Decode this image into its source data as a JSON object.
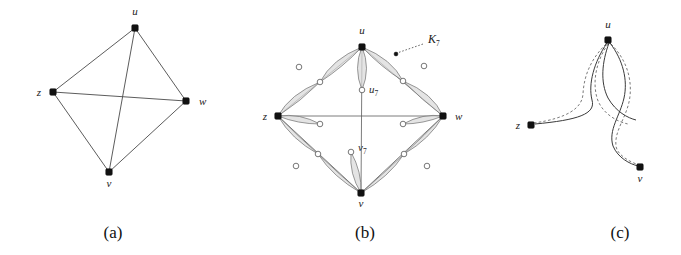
{
  "figure": {
    "width": 681,
    "height": 255,
    "background": "#ffffff",
    "edge_color": "#4a4a4a",
    "lens_fill": "#d9d9d9",
    "lens_stroke": "#6e6e6e",
    "node_filled_color": "#111111",
    "node_open_fill": "#ffffff"
  },
  "captions": [
    {
      "id": "caption-a",
      "text": "(a)",
      "x": 113,
      "y": 238
    },
    {
      "id": "caption-b",
      "text": "(b)",
      "x": 365,
      "y": 238
    },
    {
      "id": "caption-c",
      "text": "(c)",
      "x": 620,
      "y": 238
    }
  ],
  "panel_a": {
    "name": "complete-graph-k4",
    "vertices": [
      {
        "id": "u",
        "label": "u",
        "x": 135,
        "y": 28,
        "lx": 135,
        "ly": 15,
        "anchor": "middle"
      },
      {
        "id": "w",
        "label": "w",
        "x": 186,
        "y": 101,
        "lx": 199,
        "ly": 105,
        "anchor": "start"
      },
      {
        "id": "v",
        "label": "v",
        "x": 109,
        "y": 172,
        "lx": 109,
        "ly": 187,
        "anchor": "middle"
      },
      {
        "id": "z",
        "label": "z",
        "x": 53,
        "y": 92,
        "lx": 41,
        "ly": 96,
        "anchor": "end"
      }
    ],
    "edges": [
      {
        "from": "u",
        "to": "w"
      },
      {
        "from": "u",
        "to": "v"
      },
      {
        "from": "u",
        "to": "z"
      },
      {
        "from": "w",
        "to": "v"
      },
      {
        "from": "w",
        "to": "z"
      },
      {
        "from": "v",
        "to": "z"
      }
    ],
    "edge_count": 6,
    "vertex_count": 4
  },
  "panel_b": {
    "name": "k7-gadget-expansion",
    "gadget_label": "K",
    "gadget_label_sub": "7",
    "gadget_label_x": 432,
    "gadget_label_y": 42,
    "leader_from": {
      "x": 423,
      "y": 44
    },
    "leader_to": {
      "x": 397,
      "y": 53
    },
    "leader_dot": {
      "x": 396,
      "y": 54
    },
    "vertices": [
      {
        "id": "u",
        "label": "u",
        "x": 362,
        "y": 47,
        "lx": 362,
        "ly": 35,
        "anchor": "middle"
      },
      {
        "id": "w",
        "label": "w",
        "x": 443,
        "y": 116,
        "lx": 455,
        "ly": 120,
        "anchor": "start"
      },
      {
        "id": "v",
        "label": "v",
        "x": 361,
        "y": 193,
        "lx": 361,
        "ly": 207,
        "anchor": "middle"
      },
      {
        "id": "z",
        "label": "z",
        "x": 278,
        "y": 116,
        "lx": 267,
        "ly": 120,
        "anchor": "end"
      }
    ],
    "mid_nodes": [
      {
        "id": "u7",
        "label": "u",
        "sub": "7",
        "x": 362,
        "y": 90,
        "lx": 369,
        "ly": 90
      },
      {
        "id": "v7",
        "label": "v",
        "sub": "7",
        "x": 351,
        "y": 152,
        "lx": 358,
        "ly": 150
      }
    ],
    "edge_count": 6,
    "vertex_count": 4,
    "lens_per_edge": 2,
    "description": "each K4 edge replaced by two shaded lens gadgets joined at an open midpoint node"
  },
  "panel_c": {
    "name": "planar-drawing-detail",
    "vertices": [
      {
        "id": "u",
        "label": "u",
        "x": 608,
        "y": 40,
        "lx": 608,
        "ly": 28,
        "anchor": "middle"
      },
      {
        "id": "v",
        "label": "v",
        "x": 640,
        "y": 167,
        "lx": 640,
        "ly": 181,
        "anchor": "middle"
      },
      {
        "id": "z",
        "label": "z",
        "x": 531,
        "y": 125,
        "lx": 520,
        "ly": 129,
        "anchor": "end"
      }
    ],
    "solid_curve_count": 3,
    "dashed_curve_count": 3,
    "description": "u-v and u-z arcs drawn solid with parallel dashed homotopic companion curves crossing once"
  }
}
